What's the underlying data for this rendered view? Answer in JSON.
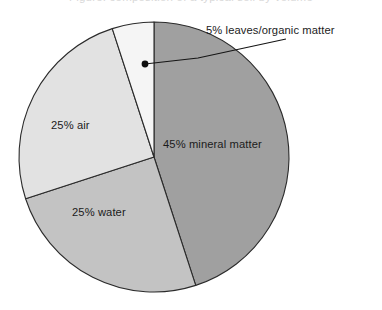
{
  "page": {
    "background_color": "#ffffff",
    "clipped_header_text": "Figure: composition of a typical soil by volume"
  },
  "chart_data": {
    "type": "pie",
    "title": "",
    "subtitle": "",
    "xlabel": "",
    "ylabel": "",
    "grid": false,
    "legend_position": "none",
    "units": "percent",
    "start_angle_deg": 0,
    "direction": "clockwise",
    "center": {
      "x": 154,
      "y": 157
    },
    "radius": 135,
    "categories": [
      "mineral matter",
      "water",
      "air",
      "leaves/organic matter"
    ],
    "values": [
      45,
      25,
      25,
      5
    ],
    "slices": [
      {
        "name": "mineral matter",
        "label": "45% mineral matter",
        "value": 45,
        "color": "#a0a0a0",
        "start_deg": 0,
        "end_deg": 162,
        "label_x": 163,
        "label_y": 148,
        "label_anchor": "start",
        "label_placement": "inside"
      },
      {
        "name": "water",
        "label": "25% water",
        "value": 25,
        "color": "#c3c3c3",
        "start_deg": 162,
        "end_deg": 252,
        "label_x": 72,
        "label_y": 216,
        "label_anchor": "start",
        "label_placement": "inside"
      },
      {
        "name": "air",
        "label": "25% air",
        "value": 25,
        "color": "#e2e2e2",
        "start_deg": 252,
        "end_deg": 342,
        "label_x": 51,
        "label_y": 129,
        "label_anchor": "start",
        "label_placement": "inside"
      },
      {
        "name": "leaves/organic matter",
        "label": "5% leaves/organic matter",
        "value": 5,
        "color": "#f5f5f5",
        "start_deg": 342,
        "end_deg": 360,
        "label_x": 206,
        "label_y": 34,
        "label_anchor": "start",
        "label_placement": "callout"
      }
    ],
    "callout": {
      "label": "5% leaves/organic matter",
      "dot_x": 145,
      "dot_y": 64,
      "dot_radius": 3.4,
      "elbow_x": 198,
      "elbow_y": 58,
      "end_x": 286,
      "end_y": 39,
      "line_color": "#151515"
    },
    "outline_color": "#2b2b2b"
  }
}
